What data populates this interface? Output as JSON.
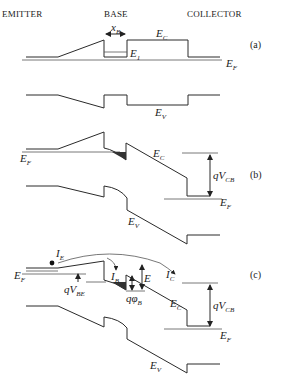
{
  "headers": {
    "emitter": "EMITTER",
    "base": "BASE",
    "collector": "COLLECTOR"
  },
  "panels": {
    "a": {
      "label": "(a)",
      "xb": {
        "main": "x",
        "sub": "B"
      },
      "ec": {
        "main": "E",
        "sub": "C"
      },
      "e1": {
        "main": "E",
        "sub": "1"
      },
      "ef": {
        "main": "E",
        "sub": "F"
      },
      "ev": {
        "main": "E",
        "sub": "V"
      }
    },
    "b": {
      "label": "(b)",
      "ef_left": {
        "main": "E",
        "sub": "F"
      },
      "ec": {
        "main": "E",
        "sub": "C"
      },
      "qvcb": {
        "main": "qV",
        "sub": "CB"
      },
      "ef_right": {
        "main": "E",
        "sub": "F"
      },
      "ev": {
        "main": "E",
        "sub": "V"
      }
    },
    "c": {
      "label": "(c)",
      "ie": {
        "main": "I",
        "sub": "E"
      },
      "ef_left": {
        "main": "E",
        "sub": "F"
      },
      "qvbe": {
        "main": "qV",
        "sub": "BE"
      },
      "ib": {
        "main": "I",
        "sub": "B"
      },
      "e": {
        "main": "E",
        "sub": ""
      },
      "ic": {
        "main": "I",
        "sub": "C"
      },
      "qphib": {
        "main": "qφ",
        "sub": "B"
      },
      "ec": {
        "main": "E",
        "sub": "C"
      },
      "qvcb": {
        "main": "qV",
        "sub": "CB"
      },
      "ef_right": {
        "main": "E",
        "sub": "F"
      },
      "ev": {
        "main": "E",
        "sub": "V"
      }
    }
  }
}
